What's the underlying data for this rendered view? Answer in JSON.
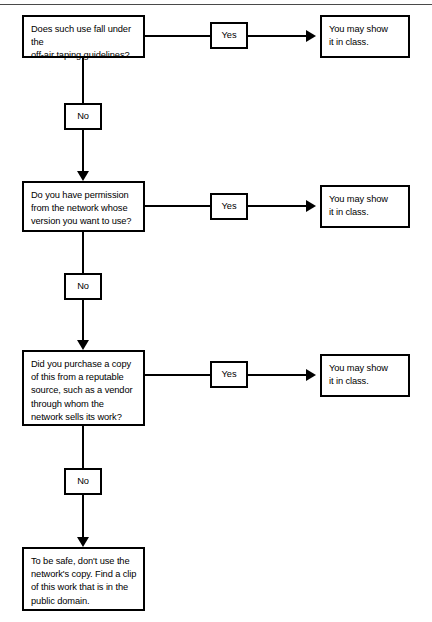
{
  "diagram": {
    "stroke_color": "#000000",
    "background_color": "#ffffff",
    "rule_color": "#4a4a4a",
    "branch_yes_label": "Yes",
    "branch_no_label": "No",
    "rows": [
      {
        "question": "Does such use fall under the\noff-air taping guidelines?",
        "yes_label": "Yes",
        "outcome": "You may show\nit in class.",
        "no_label": "No"
      },
      {
        "question": "Do you have permission\nfrom the network whose\nversion you want to use?",
        "yes_label": "Yes",
        "outcome": "You may show\nit in class.",
        "no_label": "No"
      },
      {
        "question": "Did you purchase a copy\nof this from a reputable\nsource, such as a vendor\nthrough whom the\nnetwork sells its work?",
        "yes_label": "Yes",
        "outcome": "You may show\nit in class.",
        "no_label": "No"
      }
    ],
    "final": {
      "text": "To be safe, don't use the\nnetwork's copy. Find a clip\nof this work that is in the\npublic domain."
    }
  }
}
